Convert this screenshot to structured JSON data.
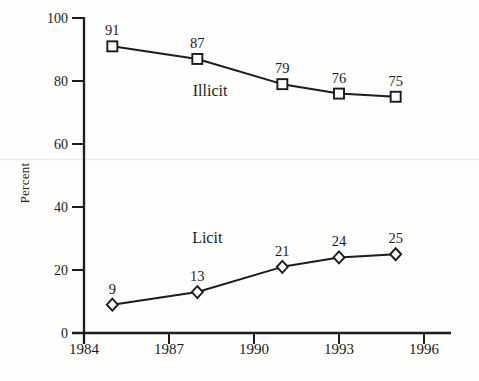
{
  "figure": {
    "background": "#fdfdfc",
    "ink": "#1c1c1c",
    "scan_artifact_color": "#ecebe8"
  },
  "chart_data": {
    "type": "line",
    "title": "",
    "xlabel": "",
    "ylabel": "Percent",
    "x": [
      1985,
      1988,
      1991,
      1993,
      1995
    ],
    "series": [
      {
        "name": "Illicit",
        "marker": "square",
        "values": [
          91,
          87,
          79,
          76,
          75
        ],
        "label": {
          "text": "Illicit",
          "x": 1988.45,
          "y": 75.2
        }
      },
      {
        "name": "Licit",
        "marker": "diamond",
        "values": [
          9,
          13,
          21,
          24,
          25
        ],
        "label": {
          "text": "Licit",
          "x": 1988.35,
          "y": 28.6
        }
      }
    ],
    "point_labels_shown": true,
    "xticks": [
      1984,
      1987,
      1990,
      1993,
      1996
    ],
    "yticks": [
      0,
      20,
      40,
      60,
      80,
      100
    ],
    "xlim": [
      1984,
      1996.95
    ],
    "ylim": [
      0,
      100
    ],
    "grid": false,
    "legend_position": "inline"
  }
}
